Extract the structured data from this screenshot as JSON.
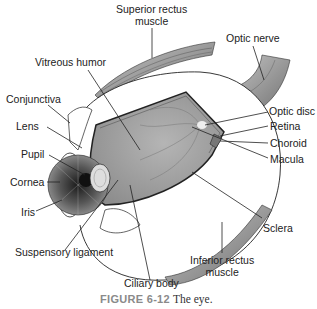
{
  "figure": {
    "title": "The eye",
    "caption": {
      "number": "FIGURE 6-12",
      "text": "The eye."
    }
  },
  "labels": {
    "superior_rectus": [
      "Superior rectus",
      "muscle"
    ],
    "optic_nerve": "Optic nerve",
    "vitreous_humor": "Vitreous humor",
    "conjunctiva": "Conjunctiva",
    "lens": "Lens",
    "pupil": "Pupil",
    "cornea": "Cornea",
    "iris": "Iris",
    "suspensory_ligament": "Suspensory ligament",
    "ciliary_body": "Ciliary body",
    "optic_disc": "Optic disc",
    "retina": "Retina",
    "choroid": "Choroid",
    "macula": "Macula",
    "sclera": "Sclera",
    "inferior_rectus": [
      "Inferior rectus",
      "muscle"
    ]
  },
  "colors": {
    "line": "#222222",
    "interior": "#9a9a9a",
    "muscle": "#8c8c8c",
    "caption_number": "#8a8a8a"
  }
}
